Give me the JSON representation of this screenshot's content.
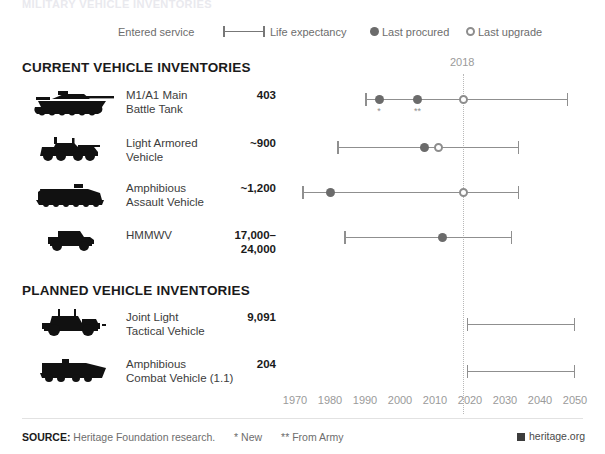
{
  "cutoff_title": "MILITARY VEHICLE INVENTORIES",
  "legend": {
    "entered_service": "Entered service",
    "life_expectancy": "Life expectancy",
    "last_procured": "Last procured",
    "last_upgrade": "Last upgrade"
  },
  "sections": {
    "current": "CURRENT VEHICLE INVENTORIES",
    "planned": "PLANNED VEHICLE INVENTORIES"
  },
  "reference_year": "2018",
  "footer": {
    "source_label": "SOURCE:",
    "source_text": "Heritage Foundation research.",
    "note_new": "* New",
    "note_army": "** From Army",
    "brand": "heritage.org"
  },
  "chart_data": {
    "type": "timeline",
    "title": "Military Vehicle Inventories",
    "xlabel": "",
    "ylabel": "",
    "xlim": [
      1967,
      2052
    ],
    "ticks": [
      1970,
      1980,
      1990,
      2000,
      2010,
      2020,
      2030,
      2040,
      2050
    ],
    "tick_labels": [
      "1970",
      "1980",
      "1990",
      "2000",
      "2010",
      "2020",
      "2030",
      "2040",
      "2050"
    ],
    "reference_line": 2018,
    "grid": false,
    "legend_position": "top",
    "series_markers": [
      {
        "name": "Entered service / Life expectancy",
        "marker": "bar-with-end-caps"
      },
      {
        "name": "Last procured",
        "marker": "filled-circle"
      },
      {
        "name": "Last upgrade",
        "marker": "open-circle"
      }
    ],
    "groups": [
      {
        "name": "CURRENT VEHICLE INVENTORIES",
        "rows": [
          {
            "vehicle": "M1/A1 Main Battle Tank",
            "name_line1": "M1/A1 Main",
            "name_line2": "Battle Tank",
            "count": "403",
            "icon": "tank-icon",
            "entered_service": 1990,
            "life_expectancy_end": 2048,
            "last_procured": 1994,
            "last_procured_2": 2005,
            "last_upgrade": 2018,
            "footnote_1": "*",
            "footnote_2": "**"
          },
          {
            "vehicle": "Light Armored Vehicle",
            "name_line1": "Light Armored",
            "name_line2": "Vehicle",
            "count": "~900",
            "icon": "lav-icon",
            "entered_service": 1982,
            "life_expectancy_end": 2034,
            "last_procured": 2007,
            "last_upgrade": 2011
          },
          {
            "vehicle": "Amphibious Assault Vehicle",
            "name_line1": "Amphibious",
            "name_line2": "Assault Vehicle",
            "count": "~1,200",
            "icon": "aav-icon",
            "entered_service": 1972,
            "life_expectancy_end": 2034,
            "last_procured": 1980,
            "last_upgrade": 2018
          },
          {
            "vehicle": "HMMWV",
            "name_line1": "HMMWV",
            "name_line2": "",
            "count": "17,000–24,000",
            "count_line1": "17,000–",
            "count_line2": "24,000",
            "icon": "hmmwv-icon",
            "entered_service": 1984,
            "life_expectancy_end": 2032,
            "last_procured": 2012,
            "last_upgrade": null
          }
        ]
      },
      {
        "name": "PLANNED VEHICLE INVENTORIES",
        "rows": [
          {
            "vehicle": "Joint Light Tactical Vehicle",
            "name_line1": "Joint Light",
            "name_line2": "Tactical Vehicle",
            "count": "9,091",
            "icon": "jltv-icon",
            "entered_service": 2019,
            "life_expectancy_end": 2050,
            "last_procured": null,
            "last_upgrade": null
          },
          {
            "vehicle": "Amphibious Combat Vehicle (1.1)",
            "name_line1": "Amphibious",
            "name_line2": "Combat Vehicle (1.1)",
            "count": "204",
            "icon": "acv-icon",
            "entered_service": 2019,
            "life_expectancy_end": 2050,
            "last_procured": null,
            "last_upgrade": null
          }
        ]
      }
    ]
  }
}
